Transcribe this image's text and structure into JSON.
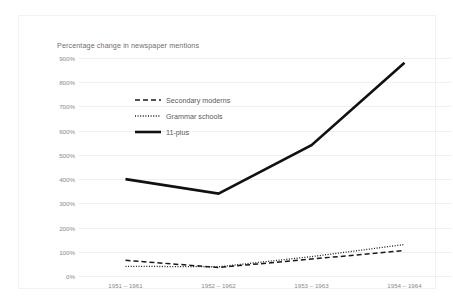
{
  "chart_data": {
    "type": "line",
    "title": "Percentage change in newspaper mentions",
    "xlabel": "",
    "ylabel": "",
    "categories": [
      "1951 – 1961",
      "1952 – 1962",
      "1953 – 1963",
      "1954 – 1964"
    ],
    "ylim": [
      0,
      900
    ],
    "ytick_labels": [
      "900%",
      "800%",
      "700%",
      "600%",
      "500%",
      "400%",
      "300%",
      "200%",
      "100%",
      "0%"
    ],
    "ytick_values": [
      900,
      800,
      700,
      600,
      500,
      400,
      300,
      200,
      100,
      0
    ],
    "grid": true,
    "legend_position": "inside-upper-left",
    "series": [
      {
        "name": "Secondary moderns",
        "style": "dashed",
        "color": "#1a1a1a",
        "values": [
          65,
          35,
          70,
          105
        ]
      },
      {
        "name": "Grammar schools",
        "style": "dotted",
        "color": "#1a1a1a",
        "values": [
          40,
          38,
          80,
          130
        ]
      },
      {
        "name": "11-plus",
        "style": "solid",
        "color": "#111111",
        "values": [
          400,
          340,
          540,
          880
        ]
      }
    ]
  },
  "legend": {
    "items": [
      {
        "label": "Secondary moderns",
        "swatch": "dashed-line-icon"
      },
      {
        "label": "Grammar schools",
        "swatch": "dotted-line-icon"
      },
      {
        "label": "11-plus",
        "swatch": "solid-line-icon"
      }
    ]
  },
  "colors": {
    "gridline": "#f0f0f0",
    "axis_text": "#8a8a8a",
    "title_text": "#6e6e6e",
    "line": "#111111",
    "card_border": "#f2f2f2",
    "background": "#ffffff"
  }
}
